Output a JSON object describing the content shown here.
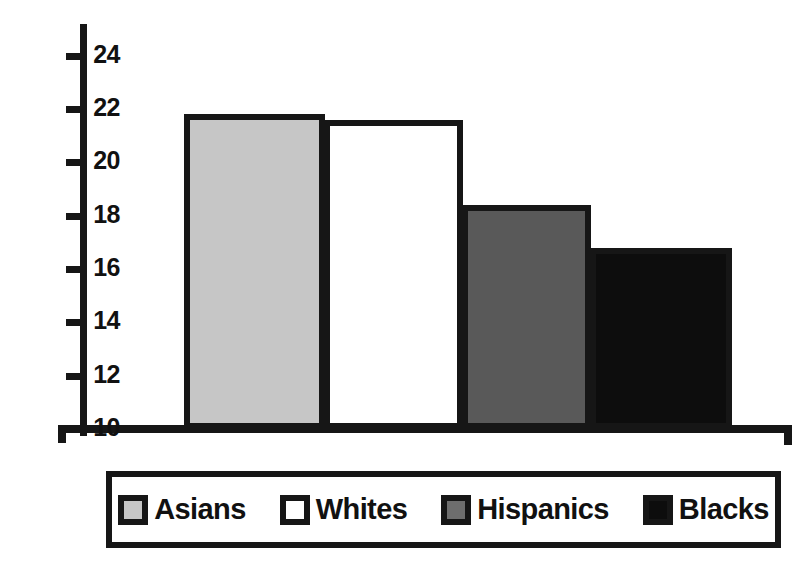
{
  "chart_data": {
    "type": "bar",
    "title": "",
    "subtitle": "",
    "xlabel": "",
    "ylabel": "",
    "categories": [
      "Asians",
      "Whites",
      "Hispanics",
      "Blacks"
    ],
    "values": [
      21.8,
      21.6,
      18.4,
      16.8
    ],
    "ylim": [
      10,
      25
    ],
    "yticks": [
      10,
      12,
      14,
      16,
      18,
      20,
      22,
      24
    ],
    "ytick_labels": [
      "10",
      "12",
      "14",
      "16",
      "18",
      "20",
      "22",
      "24"
    ],
    "xticks": [],
    "xtick_labels": [],
    "grid": false,
    "legend_position": "bottom",
    "legend": [
      {
        "label": "Asians",
        "swatch": "swatch-light",
        "color": "#c6c6c6"
      },
      {
        "label": "Whites",
        "swatch": "swatch-white",
        "color": "#ffffff"
      },
      {
        "label": "Hispanics",
        "swatch": "swatch-mid",
        "color": "#595959"
      },
      {
        "label": "Blacks",
        "swatch": "swatch-black",
        "color": "#0d0d0d"
      }
    ],
    "bar_border_color": "#161616",
    "axis_color": "#161616",
    "background_color": "#ffffff"
  }
}
